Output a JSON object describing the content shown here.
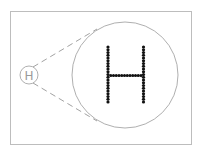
{
  "diagram": {
    "small_label": "H",
    "large_label": "H",
    "colors": {
      "frame": "#bdbdbd",
      "circle": "#9a9a9a",
      "dashed": "#8a8a8a",
      "dots": "#111111",
      "small_text": "#9a9a9a"
    }
  }
}
